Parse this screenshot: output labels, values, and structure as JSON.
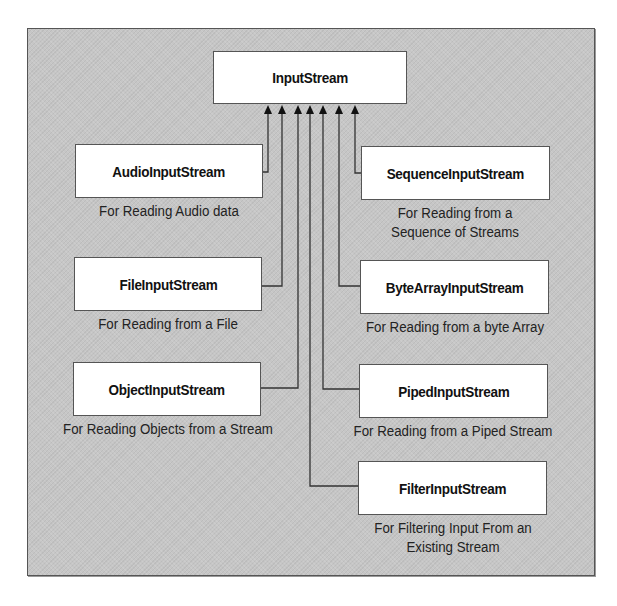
{
  "diagram": {
    "root": {
      "label": "InputStream"
    },
    "children": [
      {
        "id": "audio",
        "label": "AudioInputStream",
        "description": [
          "For Reading Audio data"
        ],
        "side": "left"
      },
      {
        "id": "file",
        "label": "FileInputStream",
        "description": [
          "For Reading from a File"
        ],
        "side": "left"
      },
      {
        "id": "object",
        "label": "ObjectInputStream",
        "description": [
          "For Reading Objects from a Stream"
        ],
        "side": "left"
      },
      {
        "id": "sequence",
        "label": "SequenceInputStream",
        "description": [
          "For Reading from a",
          "Sequence of Streams"
        ],
        "side": "right"
      },
      {
        "id": "bytearray",
        "label": "ByteArrayInputStream",
        "description": [
          "For Reading from a byte Array"
        ],
        "side": "right"
      },
      {
        "id": "piped",
        "label": "PipedInputStream",
        "description": [
          "For Reading from a Piped Stream"
        ],
        "side": "right"
      },
      {
        "id": "filter",
        "label": "FilterInputStream",
        "description": [
          "For Filtering Input From an",
          "Existing Stream"
        ],
        "side": "right"
      }
    ],
    "edges": [
      {
        "from": "audio",
        "to": "root",
        "type": "inheritance-arrow"
      },
      {
        "from": "file",
        "to": "root",
        "type": "inheritance-arrow"
      },
      {
        "from": "object",
        "to": "root",
        "type": "inheritance-arrow"
      },
      {
        "from": "filter",
        "to": "root",
        "type": "inheritance-arrow"
      },
      {
        "from": "piped",
        "to": "root",
        "type": "inheritance-arrow"
      },
      {
        "from": "bytearray",
        "to": "root",
        "type": "inheritance-arrow"
      },
      {
        "from": "sequence",
        "to": "root",
        "type": "inheritance-arrow"
      }
    ],
    "colors": {
      "background": "#c6c6c6",
      "box_fill": "#ffffff",
      "line": "#333333",
      "text": "#111111"
    }
  }
}
